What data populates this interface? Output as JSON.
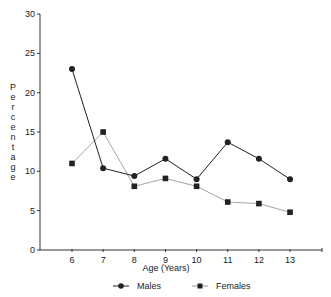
{
  "chart_data": {
    "type": "line",
    "title": "",
    "xlabel": "Age (Years)",
    "ylabel": "Percentage",
    "x": [
      6,
      7,
      8,
      9,
      10,
      11,
      12,
      13
    ],
    "categories": [
      "6",
      "7",
      "8",
      "9",
      "10",
      "11",
      "12",
      "13"
    ],
    "series": [
      {
        "name": "Males",
        "marker": "circle",
        "color": "#222222",
        "values": [
          23.0,
          10.4,
          9.4,
          11.6,
          9.0,
          13.7,
          11.6,
          9.0
        ]
      },
      {
        "name": "Females",
        "marker": "square",
        "color": "#9a9a9a",
        "values": [
          11.0,
          15.0,
          8.1,
          9.1,
          8.1,
          6.1,
          5.9,
          4.8
        ]
      }
    ],
    "ylim": [
      0,
      30
    ],
    "yticks": [
      0,
      5,
      10,
      15,
      20,
      25,
      30
    ],
    "xlim": [
      5,
      14
    ],
    "grid": false,
    "legend_position": "bottom"
  },
  "legend": {
    "males_label": "Males",
    "females_label": "Females"
  }
}
